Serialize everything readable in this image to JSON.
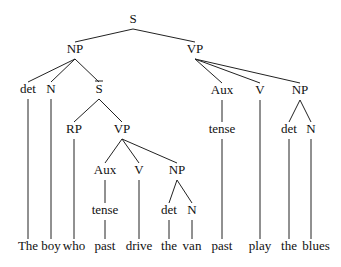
{
  "diagram": {
    "type": "syntax-tree",
    "sentence": "The boy who past drive the van past play the blues",
    "nodes": [
      {
        "id": "S",
        "label": "S",
        "x": 133,
        "y": 20,
        "parent": null
      },
      {
        "id": "NP1",
        "label": "NP",
        "x": 75,
        "y": 50,
        "parent": "S"
      },
      {
        "id": "VP1",
        "label": "VP",
        "x": 195,
        "y": 50,
        "parent": "S"
      },
      {
        "id": "det1",
        "label": "det",
        "x": 28,
        "y": 90,
        "parent": "NP1"
      },
      {
        "id": "N1",
        "label": "N",
        "x": 51,
        "y": 90,
        "parent": "NP1"
      },
      {
        "id": "Sbar",
        "label": "S",
        "x": 99,
        "y": 90,
        "parent": "NP1",
        "overbar": true
      },
      {
        "id": "RP",
        "label": "RP",
        "x": 74,
        "y": 130,
        "parent": "Sbar"
      },
      {
        "id": "VP2",
        "label": "VP",
        "x": 122,
        "y": 130,
        "parent": "Sbar"
      },
      {
        "id": "Aux2",
        "label": "Aux",
        "x": 105,
        "y": 171,
        "parent": "VP2"
      },
      {
        "id": "V2",
        "label": "V",
        "x": 139,
        "y": 171,
        "parent": "VP2"
      },
      {
        "id": "NP2",
        "label": "NP",
        "x": 177,
        "y": 171,
        "parent": "VP2"
      },
      {
        "id": "tense2",
        "label": "tense",
        "x": 105,
        "y": 211,
        "parent": "Aux2"
      },
      {
        "id": "det2",
        "label": "det",
        "x": 169,
        "y": 211,
        "parent": "NP2"
      },
      {
        "id": "N2",
        "label": "N",
        "x": 192,
        "y": 211,
        "parent": "NP2"
      },
      {
        "id": "Aux1",
        "label": "Aux",
        "x": 222,
        "y": 91,
        "parent": "VP1"
      },
      {
        "id": "V1",
        "label": "V",
        "x": 260,
        "y": 91,
        "parent": "VP1"
      },
      {
        "id": "NP3",
        "label": "NP",
        "x": 300,
        "y": 91,
        "parent": "VP1"
      },
      {
        "id": "tense1",
        "label": "tense",
        "x": 222,
        "y": 130,
        "parent": "Aux1"
      },
      {
        "id": "det3",
        "label": "det",
        "x": 289,
        "y": 130,
        "parent": "NP3"
      },
      {
        "id": "N3",
        "label": "N",
        "x": 311,
        "y": 130,
        "parent": "NP3"
      }
    ],
    "leaves": [
      {
        "label": "The",
        "x": 28,
        "parent": "det1"
      },
      {
        "label": "boy",
        "x": 51,
        "parent": "N1"
      },
      {
        "label": "who",
        "x": 74,
        "parent": "RP"
      },
      {
        "label": "past",
        "x": 105,
        "parent": "tense2"
      },
      {
        "label": "drive",
        "x": 139,
        "parent": "V2"
      },
      {
        "label": "the",
        "x": 169,
        "parent": "det2"
      },
      {
        "label": "van",
        "x": 192,
        "parent": "N2"
      },
      {
        "label": "past",
        "x": 222,
        "parent": "tense1"
      },
      {
        "label": "play",
        "x": 260,
        "parent": "V1"
      },
      {
        "label": "the",
        "x": 289,
        "parent": "det3"
      },
      {
        "label": "blues",
        "x": 316,
        "parent": "N3"
      }
    ],
    "leaf_y": 247
  }
}
